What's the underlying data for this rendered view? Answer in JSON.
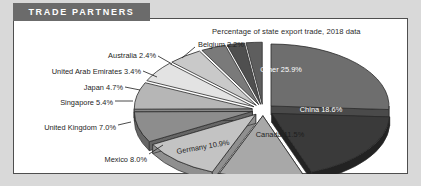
{
  "banner": {
    "title": "TRADE PARTNERS"
  },
  "subtitle": "Percentage of state export trade, 2018 data",
  "colors": {
    "banner_bg": "#6b6b6b",
    "frame_border": "#4f4f4f",
    "page_bg": "#d9d9d9",
    "card_bg": "#ffffff"
  },
  "chart_data": {
    "type": "pie",
    "title": "TRADE PARTNERS",
    "subtitle": "Percentage of state export trade, 2018 data",
    "unit": "percent",
    "exploded": true,
    "three_d": true,
    "legend": "none",
    "labels_inside": [
      "Other 25.9%",
      "China 18.6%",
      "Canada 11.5%",
      "Germany 10.9%"
    ],
    "categories": [
      "Other",
      "China",
      "Canada",
      "Germany",
      "Mexico",
      "United Kingdom",
      "Singapore",
      "Japan",
      "United Arab Emirates",
      "Australia",
      "Belgium"
    ],
    "values": [
      25.9,
      18.6,
      11.5,
      10.9,
      8.0,
      7.0,
      5.4,
      4.7,
      3.4,
      2.4,
      2.2
    ],
    "slices": [
      {
        "name": "Other",
        "value": 25.9,
        "label": "Other 25.9%",
        "placement": "inside",
        "fill": "#6e6e6e",
        "side": "#4a4a4a",
        "text": "#ffffff"
      },
      {
        "name": "China",
        "value": 18.6,
        "label": "China 18.6%",
        "placement": "inside",
        "fill": "#3a3a3a",
        "side": "#222222",
        "text": "#ffffff"
      },
      {
        "name": "Canada",
        "value": 11.5,
        "label": "Canada 11.5%",
        "placement": "inside",
        "fill": "#a8a8a8",
        "side": "#7d7d7d",
        "text": "#1d1d1d"
      },
      {
        "name": "Germany",
        "value": 10.9,
        "label": "Germany 10.9%",
        "placement": "inside",
        "fill": "#c3c3c3",
        "side": "#8f8f8f",
        "text": "#1d1d1d"
      },
      {
        "name": "Mexico",
        "value": 8.0,
        "label": "Mexico 8.0%",
        "placement": "outside",
        "fill": "#8d8d8d",
        "side": "#666666",
        "text": "#1d1d1d"
      },
      {
        "name": "United Kingdom",
        "value": 7.0,
        "label": "United Kingdom 7.0%",
        "placement": "outside",
        "fill": "#b6b6b6",
        "side": "#878787",
        "text": "#1d1d1d"
      },
      {
        "name": "Singapore",
        "value": 5.4,
        "label": "Singapore 5.4%",
        "placement": "outside",
        "fill": "#e3e3e3",
        "side": "#a9a9a9",
        "text": "#1d1d1d"
      },
      {
        "name": "Japan",
        "value": 4.7,
        "label": "Japan 4.7%",
        "placement": "outside",
        "fill": "#c9c9c9",
        "side": "#949494",
        "text": "#1d1d1d"
      },
      {
        "name": "United Arab Emirates",
        "value": 3.4,
        "label": "United Arab Emirates 3.4%",
        "placement": "outside",
        "fill": "#7a7a7a",
        "side": "#565656",
        "text": "#1d1d1d"
      },
      {
        "name": "Australia",
        "value": 2.4,
        "label": "Australia 2.4%",
        "placement": "outside",
        "fill": "#4f4f4f",
        "side": "#343434",
        "text": "#1d1d1d"
      },
      {
        "name": "Belgium",
        "value": 2.2,
        "label": "Belgium 2.2%",
        "placement": "outside",
        "fill": "#5e5e5e",
        "side": "#3d3d3d",
        "text": "#1d1d1d"
      }
    ]
  },
  "outside_labels": [
    {
      "key": "belgium",
      "text": "Belgium 2.2%",
      "x": 198,
      "y": 41,
      "align": "left",
      "lx1": 195,
      "ly1": 47,
      "lx2": 182,
      "ly2": 58
    },
    {
      "key": "australia",
      "text": "Australia 2.4%",
      "x": 156,
      "y": 52,
      "align": "right",
      "lx1": 158,
      "ly1": 56,
      "lx2": 172,
      "ly2": 64
    },
    {
      "key": "uae",
      "text": "United Arab Emirates 3.4%",
      "x": 141,
      "y": 68,
      "align": "right",
      "lx1": 143,
      "ly1": 71,
      "lx2": 157,
      "ly2": 77
    },
    {
      "key": "japan",
      "text": "Japan 4.7%",
      "x": 123,
      "y": 84,
      "align": "right",
      "lx1": 125,
      "ly1": 87,
      "lx2": 140,
      "ly2": 90
    },
    {
      "key": "singapore",
      "text": "Singapore 5.4%",
      "x": 113,
      "y": 99,
      "align": "right",
      "lx1": 115,
      "ly1": 101,
      "lx2": 133,
      "ly2": 101
    },
    {
      "key": "uk",
      "text": "United Kingdom 7.0%",
      "x": 116,
      "y": 124,
      "align": "right",
      "lx1": 118,
      "ly1": 125,
      "lx2": 131,
      "ly2": 122
    },
    {
      "key": "mexico",
      "text": "Mexico 8.0%",
      "x": 147,
      "y": 156,
      "align": "right",
      "lx1": 149,
      "ly1": 154,
      "lx2": 163,
      "ly2": 145
    }
  ],
  "inside_labels": [
    {
      "key": "other",
      "text": "Other 25.9%",
      "x": 281,
      "y": 70,
      "tone": "white",
      "rot": 0
    },
    {
      "key": "china",
      "text": "China 18.6%",
      "x": 321,
      "y": 110,
      "tone": "white",
      "rot": 0
    },
    {
      "key": "canada",
      "text": "Canada 11.5%",
      "x": 280,
      "y": 135,
      "tone": "dark",
      "rot": 0
    },
    {
      "key": "germany",
      "text": "Germany 10.9%",
      "x": 203,
      "y": 147,
      "tone": "dark",
      "rot": -10
    }
  ]
}
